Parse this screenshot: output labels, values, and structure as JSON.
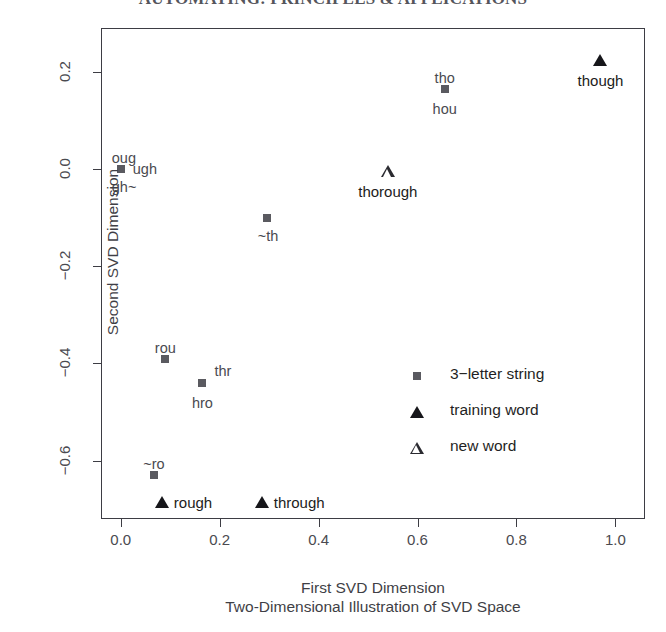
{
  "page_header": "AUTOMATING: PRINCIPLES & APPLICATIONS",
  "chart_data": {
    "type": "scatter",
    "title": "",
    "xlabel": "First SVD Dimension",
    "sublabel": "Two-Dimensional Illustration of SVD Space",
    "ylabel": "Second SVD Dimension",
    "xlim": [
      -0.04,
      1.06
    ],
    "ylim": [
      -0.72,
      0.29
    ],
    "grid": false,
    "x_ticks": [
      {
        "value": 0.0,
        "label": "0.0"
      },
      {
        "value": 0.2,
        "label": "0.2"
      },
      {
        "value": 0.4,
        "label": "0.4"
      },
      {
        "value": 0.6,
        "label": "0.6"
      },
      {
        "value": 0.8,
        "label": "0.8"
      },
      {
        "value": 1.0,
        "label": "1.0"
      }
    ],
    "y_ticks": [
      {
        "value": 0.2,
        "label": "0.2"
      },
      {
        "value": 0.0,
        "label": "0.0"
      },
      {
        "value": -0.2,
        "label": "-0.2"
      },
      {
        "value": -0.4,
        "label": "-0.4"
      },
      {
        "value": -0.6,
        "label": "-0.6"
      }
    ],
    "legend_position": "center-right",
    "series": [
      {
        "name": "3-letter string",
        "marker": "filled-square",
        "points": [
          {
            "x": 0.655,
            "y": 0.165,
            "labels": [
              {
                "text": "tho",
                "pos": "above"
              },
              {
                "text": "hou",
                "pos": "below"
              }
            ]
          },
          {
            "x": 0.0,
            "y": 0.0,
            "labels": [
              {
                "text": "oug",
                "pos": "above-left"
              },
              {
                "text": "ugh",
                "pos": "right"
              },
              {
                "text": "gh~",
                "pos": "below-left"
              }
            ]
          },
          {
            "x": 0.295,
            "y": -0.1,
            "labels": [
              {
                "text": "~th",
                "pos": "below-left"
              }
            ]
          },
          {
            "x": 0.09,
            "y": -0.39,
            "labels": [
              {
                "text": "rou",
                "pos": "above"
              }
            ]
          },
          {
            "x": 0.165,
            "y": -0.44,
            "labels": [
              {
                "text": "thr",
                "pos": "above-right"
              },
              {
                "text": "hro",
                "pos": "below"
              }
            ]
          },
          {
            "x": 0.067,
            "y": -0.63,
            "labels": [
              {
                "text": "~ro",
                "pos": "above"
              }
            ]
          }
        ]
      },
      {
        "name": "training word",
        "marker": "filled-triangle",
        "points": [
          {
            "x": 0.97,
            "y": 0.225,
            "labels": [
              {
                "text": "though",
                "pos": "below"
              }
            ]
          },
          {
            "x": 0.083,
            "y": -0.685,
            "labels": [
              {
                "text": "rough",
                "pos": "right"
              }
            ]
          },
          {
            "x": 0.285,
            "y": -0.685,
            "labels": [
              {
                "text": "through",
                "pos": "right"
              }
            ]
          }
        ]
      },
      {
        "name": "new word",
        "marker": "open-triangle",
        "points": [
          {
            "x": 0.54,
            "y": -0.005,
            "labels": [
              {
                "text": "thorough",
                "pos": "below"
              }
            ]
          }
        ]
      }
    ],
    "legend": [
      {
        "label": "3-letter string",
        "marker": "filled-square"
      },
      {
        "label": "training word",
        "marker": "filled-triangle"
      },
      {
        "label": "new word",
        "marker": "open-triangle"
      }
    ]
  }
}
